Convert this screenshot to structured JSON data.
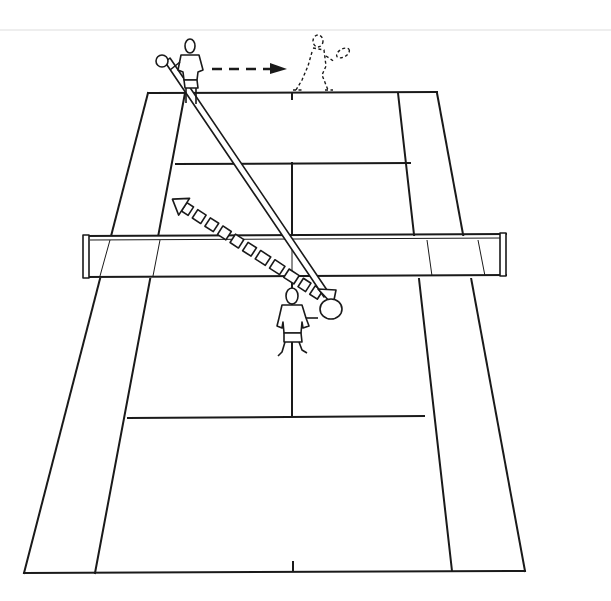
{
  "diagram": {
    "colors": {
      "background": "#ffffff",
      "ink": "#1a1a1a"
    },
    "elements": {
      "court": "doubles tennis court with singles sidelines, service lines and center service line",
      "net": "net across middle of court with posts",
      "far_player": "player at far baseline (solid outline) holding racket",
      "far_player_ghost": "dashed outline of far player after moving right",
      "movement_arrow": "dashed arrow showing far player moving right along baseline",
      "near_player": "player near the net on near side of court",
      "shot_path_solid": "solid double-line arrow from far player to near player's racket",
      "shot_path_dashed": "dashed double-line arrow from near player back toward far court"
    }
  }
}
